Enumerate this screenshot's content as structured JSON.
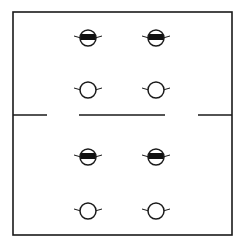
{
  "diagram": {
    "type": "floor-plan-fixture-layout",
    "colors": {
      "line": "#1a1a1a",
      "background": "#ffffff",
      "fill": "#111111"
    },
    "outline": {
      "x": 13,
      "y": 12,
      "width": 219,
      "height": 223
    },
    "partition": {
      "y": 115,
      "segments": [
        {
          "x1": 13,
          "x2": 47
        },
        {
          "x1": 79,
          "x2": 165
        },
        {
          "x1": 198,
          "x2": 232
        }
      ]
    },
    "rooms": [
      {
        "name": "upper-room",
        "fixtures": [
          {
            "kind": "banded",
            "cx": 88,
            "cy": 38
          },
          {
            "kind": "banded",
            "cx": 156,
            "cy": 38
          },
          {
            "kind": "open",
            "cx": 88,
            "cy": 90
          },
          {
            "kind": "open",
            "cx": 156,
            "cy": 90
          }
        ]
      },
      {
        "name": "lower-room",
        "fixtures": [
          {
            "kind": "banded",
            "cx": 88,
            "cy": 157
          },
          {
            "kind": "banded",
            "cx": 156,
            "cy": 157
          },
          {
            "kind": "open",
            "cx": 88,
            "cy": 211
          },
          {
            "kind": "open",
            "cx": 156,
            "cy": 211
          }
        ]
      }
    ],
    "fixture_radius": 8
  }
}
